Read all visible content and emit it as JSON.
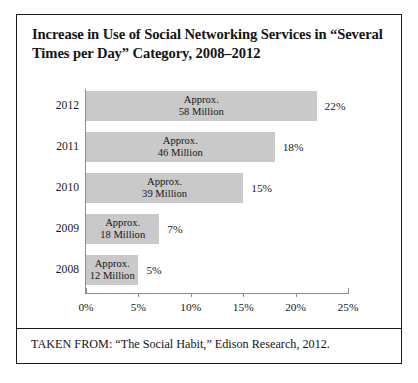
{
  "figure": {
    "title": "Increase in Use of Social Networking Services in “Several Times per Day” Category, 2008–2012",
    "source_note": "TAKEN FROM: “The Social Habit,” Edison Research, 2012."
  },
  "chart_data": {
    "type": "bar",
    "orientation": "horizontal",
    "title": "Increase in Use of Social Networking Services in “Several Times per Day” Category, 2008–2012",
    "xlabel": "",
    "ylabel": "",
    "xlim": [
      0,
      25
    ],
    "xticks": [
      0,
      5,
      10,
      15,
      20,
      25
    ],
    "xticklabels": [
      "0%",
      "5%",
      "10%",
      "15%",
      "20%",
      "25%"
    ],
    "grid": false,
    "legend": false,
    "bar_color": "#c9c9c9",
    "categories": [
      "2012",
      "2011",
      "2010",
      "2009",
      "2008"
    ],
    "values": [
      22,
      18,
      15,
      7,
      5
    ],
    "data_labels": [
      "22%",
      "18%",
      "15%",
      "7%",
      "5%"
    ],
    "annotations": [
      "Approx. 58 Million",
      "Approx. 46 Million",
      "Approx. 39 Million",
      "Approx. 18 Million",
      "Approx. 12 Million"
    ],
    "bars": [
      {
        "year": "2012",
        "percent": 22,
        "pct_label": "22%",
        "approx_line1": "Approx.",
        "approx_line2": "58 Million",
        "users_millions": 58
      },
      {
        "year": "2011",
        "percent": 18,
        "pct_label": "18%",
        "approx_line1": "Approx.",
        "approx_line2": "46 Million",
        "users_millions": 46
      },
      {
        "year": "2010",
        "percent": 15,
        "pct_label": "15%",
        "approx_line1": "Approx.",
        "approx_line2": "39 Million",
        "users_millions": 39
      },
      {
        "year": "2009",
        "percent": 7,
        "pct_label": "7%",
        "approx_line1": "Approx.",
        "approx_line2": "18 Million",
        "users_millions": 18
      },
      {
        "year": "2008",
        "percent": 5,
        "pct_label": "5%",
        "approx_line1": "Approx.",
        "approx_line2": "12 Million",
        "users_millions": 12
      }
    ]
  }
}
